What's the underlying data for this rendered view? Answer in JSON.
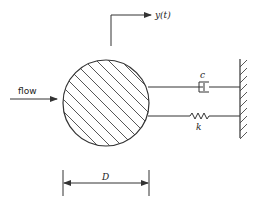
{
  "diagram": {
    "type": "mechanical-schematic",
    "labels": {
      "flow": "flow",
      "displacement": "y(t)",
      "damper": "c",
      "spring": "k",
      "diameter": "D"
    },
    "elements": [
      {
        "id": "cylinder",
        "kind": "hatched-circle"
      },
      {
        "id": "damper",
        "kind": "dashpot",
        "label": "c"
      },
      {
        "id": "spring",
        "kind": "spring",
        "label": "k"
      },
      {
        "id": "wall",
        "kind": "fixed-support"
      },
      {
        "id": "flow-arrow",
        "kind": "arrow",
        "label": "flow"
      },
      {
        "id": "displacement-arrow",
        "kind": "arrow",
        "label": "y(t)"
      },
      {
        "id": "diameter-dimension",
        "kind": "dimension-line",
        "label": "D"
      }
    ],
    "colors": {
      "stroke": "#333333",
      "background": "#ffffff"
    }
  }
}
